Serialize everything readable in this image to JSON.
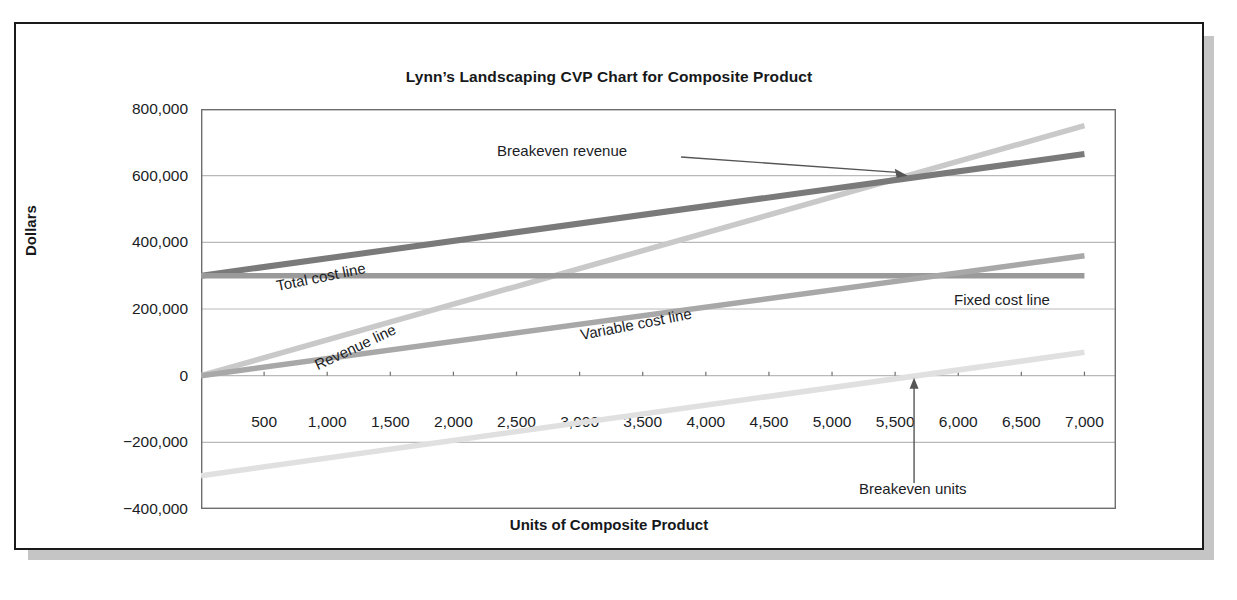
{
  "chart_data": {
    "type": "line",
    "title": "Lynn’s Landscaping CVP Chart for Composite Product",
    "xlabel": "Units of Composite Product",
    "ylabel": "Dollars",
    "xlim": [
      0,
      7250
    ],
    "ylim": [
      -400000,
      800000
    ],
    "grid": true,
    "legend_position": "inline-labels",
    "xticks": [
      "500",
      "1,000",
      "1,500",
      "2,000",
      "2,500",
      "3,000",
      "3,500",
      "4,000",
      "4,500",
      "5,000",
      "5,500",
      "6,000",
      "6,500",
      "7,000"
    ],
    "xtick_values": [
      500,
      1000,
      1500,
      2000,
      2500,
      3000,
      3500,
      4000,
      4500,
      5000,
      5500,
      6000,
      6500,
      7000
    ],
    "yticks": [
      "800,000",
      "600,000",
      "400,000",
      "200,000",
      "0",
      "−200,000",
      "−400,000"
    ],
    "ytick_values": [
      800000,
      600000,
      400000,
      200000,
      0,
      -200000,
      -400000
    ],
    "x": [
      0,
      7000
    ],
    "series": [
      {
        "name": "Revenue line",
        "values": [
          0,
          750000
        ],
        "color": "#c9c9c9",
        "width": 5.5,
        "labeled": true
      },
      {
        "name": "Total cost line",
        "values": [
          300000,
          665000
        ],
        "color": "#7a7a7a",
        "width": 6.0,
        "labeled": true
      },
      {
        "name": "Fixed cost line",
        "values": [
          300000,
          300000
        ],
        "color": "#9a9a9a",
        "width": 5.5,
        "labeled": true
      },
      {
        "name": "Variable cost line",
        "values": [
          0,
          360000
        ],
        "color": "#a8a8a8",
        "width": 5.5,
        "labeled": true
      },
      {
        "name": "Profit line",
        "values": [
          -300000,
          70000
        ],
        "color": "#e0e0e0",
        "width": 5.5,
        "labeled": false
      }
    ],
    "annotations": [
      {
        "name": "breakeven-revenue",
        "text": "Breakeven revenue",
        "point_x": 5600,
        "point_y": 600000
      },
      {
        "name": "breakeven-units",
        "text": "Breakeven units",
        "point_x": 5650,
        "point_y": 0
      }
    ],
    "breakeven": {
      "units": 5600,
      "revenue": 600000
    }
  },
  "labels": {
    "revenue": "Revenue line",
    "total_cost": "Total cost line",
    "fixed_cost": "Fixed cost line",
    "variable_cost": "Variable cost line",
    "breakeven_revenue": "Breakeven revenue",
    "breakeven_units": "Breakeven units"
  }
}
